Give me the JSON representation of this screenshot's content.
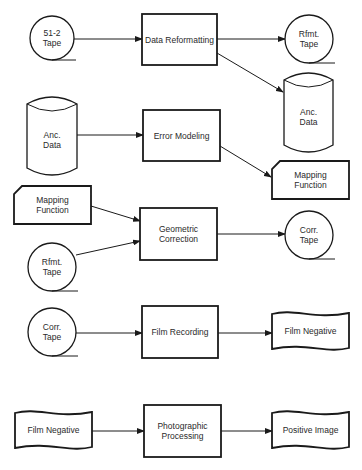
{
  "diagram": {
    "type": "flowchart",
    "colors": {
      "line": "#1a1a1a",
      "text": "#2a2a2a",
      "background": "#ffffff"
    },
    "rows": [
      {
        "id": "row1",
        "nodes": [
          {
            "id": "tape512",
            "shape": "tape",
            "lines": [
              "51-2",
              "Tape"
            ],
            "cx": 52,
            "cy": 38,
            "r": 22
          },
          {
            "id": "dataReformatting",
            "shape": "process",
            "lines": [
              "Data Reformatting"
            ],
            "x": 142,
            "y": 14,
            "w": 75,
            "h": 51
          },
          {
            "id": "rfmtTapeOut",
            "shape": "tape",
            "lines": [
              "Rfmt.",
              "Tape"
            ],
            "cx": 309,
            "cy": 39,
            "r": 24
          },
          {
            "id": "ancDataOut",
            "shape": "disk",
            "lines": [
              "Anc.",
              "Data"
            ],
            "x": 284,
            "y": 73,
            "w": 49,
            "h": 79
          }
        ]
      },
      {
        "id": "row2",
        "nodes": [
          {
            "id": "ancDataIn",
            "shape": "disk",
            "lines": [
              "Anc.",
              "Data"
            ],
            "x": 27,
            "y": 97,
            "w": 50,
            "h": 78
          },
          {
            "id": "errorModeling",
            "shape": "process",
            "lines": [
              "Error Modeling"
            ],
            "x": 143,
            "y": 110,
            "w": 77,
            "h": 51
          },
          {
            "id": "mappingFunctionOut",
            "shape": "card",
            "lines": [
              "Mapping",
              "Function"
            ],
            "x": 272,
            "y": 161,
            "w": 77,
            "h": 38
          }
        ]
      },
      {
        "id": "row3",
        "nodes": [
          {
            "id": "mappingFunctionIn",
            "shape": "card",
            "lines": [
              "Mapping",
              "Function"
            ],
            "x": 14,
            "y": 186,
            "w": 77,
            "h": 38
          },
          {
            "id": "rfmtTapeIn",
            "shape": "tape",
            "lines": [
              "Rfmt.",
              "Tape"
            ],
            "cx": 52,
            "cy": 267,
            "r": 24
          },
          {
            "id": "geometricCorrection",
            "shape": "process",
            "lines": [
              "Geometric",
              "Correction"
            ],
            "x": 140,
            "y": 208,
            "w": 77,
            "h": 52
          },
          {
            "id": "corrTapeOut",
            "shape": "tape",
            "lines": [
              "Corr.",
              "Tape"
            ],
            "cx": 309,
            "cy": 235,
            "r": 24
          }
        ]
      },
      {
        "id": "row4",
        "nodes": [
          {
            "id": "corrTapeIn",
            "shape": "tape",
            "lines": [
              "Corr.",
              "Tape"
            ],
            "cx": 52,
            "cy": 332,
            "r": 24
          },
          {
            "id": "filmRecording",
            "shape": "process",
            "lines": [
              "Film Recording"
            ],
            "x": 142,
            "y": 306,
            "w": 76,
            "h": 52
          },
          {
            "id": "filmNegativeOut",
            "shape": "document",
            "lines": [
              "Film Negative"
            ],
            "x": 272,
            "y": 312,
            "w": 77,
            "h": 38
          }
        ]
      },
      {
        "id": "row5",
        "nodes": [
          {
            "id": "filmNegativeIn",
            "shape": "document",
            "lines": [
              "Film Negative"
            ],
            "x": 15,
            "y": 411,
            "w": 77,
            "h": 38
          },
          {
            "id": "photographicProcessing",
            "shape": "process",
            "lines": [
              "Photographic",
              "Processing"
            ],
            "x": 144,
            "y": 405,
            "w": 77,
            "h": 52
          },
          {
            "id": "positiveImage",
            "shape": "document",
            "lines": [
              "Positive Image"
            ],
            "x": 272,
            "y": 411,
            "w": 77,
            "h": 38
          }
        ]
      }
    ],
    "edges": [
      {
        "from": "tape512",
        "to": "dataReformatting",
        "x1": 74,
        "y1": 39,
        "x2": 142,
        "y2": 39
      },
      {
        "from": "dataReformatting",
        "to": "rfmtTapeOut",
        "x1": 217,
        "y1": 39,
        "x2": 285,
        "y2": 39
      },
      {
        "from": "dataReformatting",
        "to": "ancDataOut",
        "x1": 217,
        "y1": 53,
        "x2": 283,
        "y2": 92
      },
      {
        "from": "ancDataIn",
        "to": "errorModeling",
        "x1": 77,
        "y1": 135,
        "x2": 143,
        "y2": 135
      },
      {
        "from": "errorModeling",
        "to": "mappingFunctionOut",
        "x1": 220,
        "y1": 146,
        "x2": 271,
        "y2": 177
      },
      {
        "from": "mappingFunctionIn",
        "to": "geometricCorrection",
        "x1": 91,
        "y1": 206,
        "x2": 140,
        "y2": 221
      },
      {
        "from": "rfmtTapeIn",
        "to": "geometricCorrection",
        "x1": 76,
        "y1": 255,
        "x2": 140,
        "y2": 241
      },
      {
        "from": "geometricCorrection",
        "to": "corrTapeOut",
        "x1": 217,
        "y1": 234,
        "x2": 285,
        "y2": 234
      },
      {
        "from": "corrTapeIn",
        "to": "filmRecording",
        "x1": 76,
        "y1": 333,
        "x2": 142,
        "y2": 333
      },
      {
        "from": "filmRecording",
        "to": "filmNegativeOut",
        "x1": 218,
        "y1": 333,
        "x2": 272,
        "y2": 333
      },
      {
        "from": "filmNegativeIn",
        "to": "photographicProcessing",
        "x1": 92,
        "y1": 431,
        "x2": 144,
        "y2": 431
      },
      {
        "from": "photographicProcessing",
        "to": "positiveImage",
        "x1": 221,
        "y1": 431,
        "x2": 272,
        "y2": 431
      }
    ]
  }
}
